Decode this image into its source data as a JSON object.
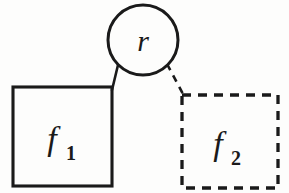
{
  "diagram": {
    "background_color": "#fdfdfc",
    "ink_color": "#1a1a1a",
    "nodes": {
      "relation": {
        "label": "r",
        "shape": "circle",
        "border_style": "solid",
        "cx": 143,
        "cy": 40,
        "r": 35,
        "label_x": 143,
        "label_y": 51
      },
      "function_one": {
        "label": "f",
        "subscript": "1",
        "shape": "square",
        "border_style": "solid",
        "x": 13,
        "y": 87,
        "width": 99,
        "height": 99,
        "label_x": 52,
        "label_y": 150,
        "sub_x": 71,
        "sub_y": 160
      },
      "function_two": {
        "label": "f",
        "subscript": "2",
        "shape": "square",
        "border_style": "dashed",
        "x": 182,
        "y": 95,
        "width": 96,
        "height": 93,
        "label_x": 218,
        "label_y": 155,
        "sub_x": 236,
        "sub_y": 165
      }
    },
    "edges": [
      {
        "name": "relation-to-f1",
        "style": "solid",
        "from": "relation",
        "to": "function_one",
        "x1": 118,
        "y1": 65,
        "x2": 112,
        "y2": 90
      },
      {
        "name": "relation-to-f2",
        "style": "dashed",
        "from": "relation",
        "to": "function_two",
        "x1": 167,
        "y1": 64,
        "x2": 183,
        "y2": 94
      }
    ]
  }
}
